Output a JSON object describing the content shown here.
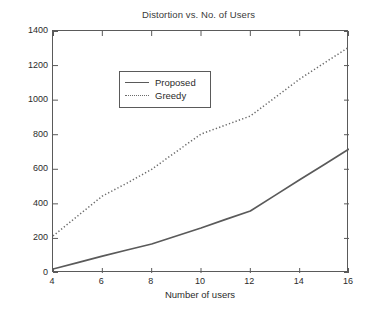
{
  "chart_data": {
    "type": "line",
    "title": "Distortion vs. No. of Users",
    "xlabel": "Number of users",
    "ylabel": "D_sum (MSE)",
    "ylabel_parts": {
      "symbol": "D",
      "subscript": "sum",
      "unit": "(MSE)"
    },
    "xlim": [
      4,
      16
    ],
    "ylim": [
      0,
      1400
    ],
    "xticks": [
      4,
      6,
      8,
      10,
      12,
      14,
      16
    ],
    "yticks": [
      0,
      200,
      400,
      600,
      800,
      1000,
      1200,
      1400
    ],
    "grid": false,
    "legend_position": "upper left",
    "x": [
      4,
      5,
      6,
      7,
      8,
      9,
      10,
      11,
      12,
      13,
      14,
      15,
      16
    ],
    "series": [
      {
        "name": "Proposed",
        "style": "solid",
        "color": "#5a5a5a",
        "values": [
          23,
          60,
          98,
          133,
          168,
          214,
          260,
          310,
          359,
          449,
          540,
          628,
          717
        ]
      },
      {
        "name": "Greedy",
        "style": "dotted",
        "color": "#6b6b6b",
        "values": [
          214,
          330,
          445,
          520,
          600,
          702,
          804,
          856,
          908,
          1015,
          1122,
          1215,
          1307
        ]
      }
    ]
  },
  "legend": {
    "items": [
      {
        "label": "Proposed"
      },
      {
        "label": "Greedy"
      }
    ]
  },
  "axis": {
    "y_tick_labels": [
      "1400",
      "1200",
      "1000",
      "800",
      "600",
      "400",
      "200",
      "0"
    ],
    "x_tick_labels": [
      "4",
      "6",
      "8",
      "10",
      "12",
      "14",
      "16"
    ]
  }
}
